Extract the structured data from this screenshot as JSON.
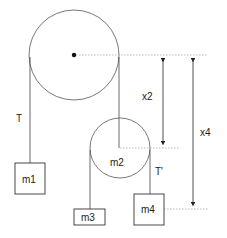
{
  "diagram": {
    "type": "pulley system",
    "labels": {
      "tension_left": "T",
      "tension_right": "T'",
      "mass1": "m1",
      "mass2": "m2",
      "mass3": "m3",
      "mass4": "m4",
      "dist_x2": "x2",
      "dist_x4": "x4"
    },
    "colors": {
      "stroke": "#444444",
      "dotted": "#aaaaaa"
    }
  }
}
